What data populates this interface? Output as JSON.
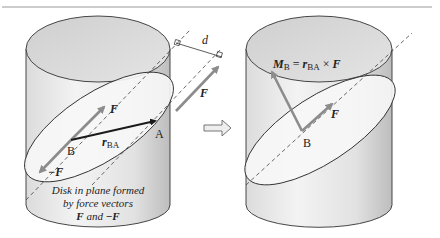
{
  "figure": {
    "left_panel": {
      "labels": {
        "distance": "d",
        "force_top": "F",
        "force_right": "F",
        "force_neg": "−F",
        "point_b": "B",
        "point_a": "A",
        "position_vector_main": "r",
        "position_vector_sub": "BA"
      },
      "caption": {
        "line1": "Disk in plane formed",
        "line2": "by force vectors",
        "line3_f": "F",
        "line3_and": " and ",
        "line3_negf": "−F"
      }
    },
    "transition_arrow": "right-arrow",
    "right_panel": {
      "labels": {
        "moment_m": "M",
        "moment_sub": "B",
        "equals": " = ",
        "r": "r",
        "r_sub": "BA",
        "cross": " × ",
        "f": "F",
        "force": "F",
        "point_b": "B"
      }
    },
    "colors": {
      "cylinder_top": "#d6d6d6",
      "cylinder_body": "#ededed",
      "cylinder_shade": "#c9c9c9",
      "disk_fill": "#f6f6f6",
      "force_arrow": "#8c8c8c",
      "position_arrow": "#1a1a1a",
      "outline": "#333333",
      "top_rule": "#999999"
    }
  }
}
